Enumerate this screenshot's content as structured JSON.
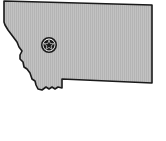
{
  "map": {
    "region": "Montana",
    "fill_color": "#bdbdbd",
    "stroke_color": "#1a1a1a",
    "background_color": "#ffffff",
    "marker": {
      "type": "star-in-circle",
      "meaning": "state capital",
      "label": "Helena",
      "x": 49,
      "y": 45,
      "radius": 7
    }
  }
}
